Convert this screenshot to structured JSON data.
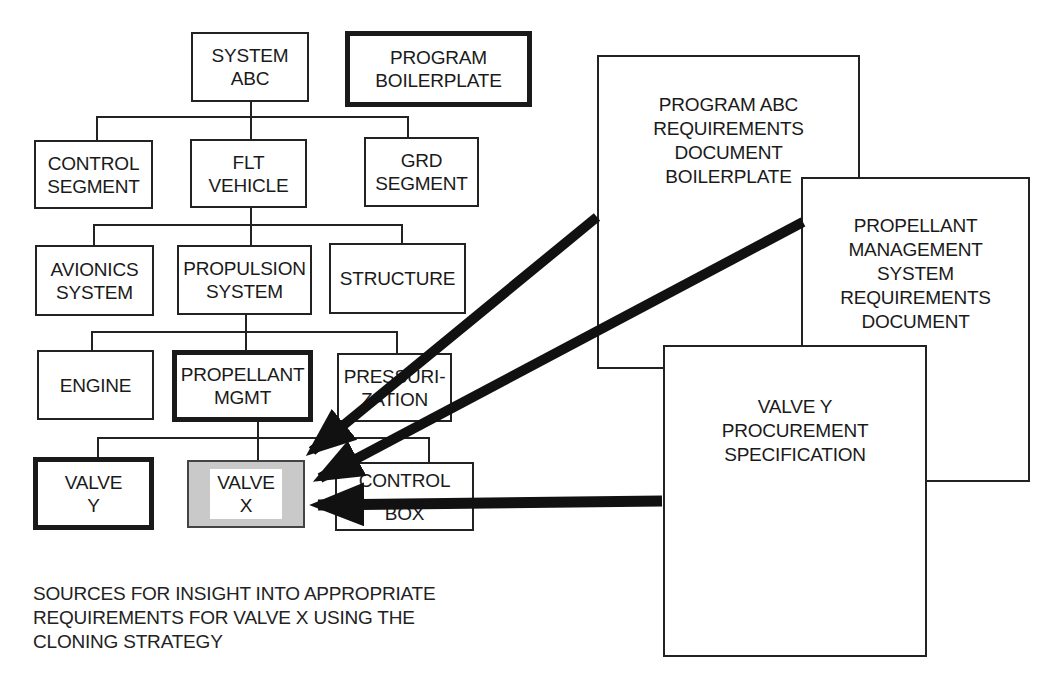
{
  "diagram": {
    "tree": {
      "system_abc": "SYSTEM\nABC",
      "program_boilerplate": "PROGRAM\nBOILERPLATE",
      "control_segment": "CONTROL\nSEGMENT",
      "flt_vehicle": "FLT\nVEHICLE",
      "grd_segment": "GRD\nSEGMENT",
      "avionics_system": "AVIONICS\nSYSTEM",
      "propulsion_system": "PROPULSION\nSYSTEM",
      "structure": "STRUCTURE",
      "engine": "ENGINE",
      "propellant_mgmt": "PROPELLANT\nMGMT",
      "pressurization": "PRESSURI-\nZATION",
      "valve_y": "VALVE\nY",
      "valve_x": "VALVE\nX",
      "control_box": "CONTROL\nBOX"
    },
    "documents": [
      {
        "label": "PROGRAM ABC\nREQUIREMENTS\nDOCUMENT\nBOILERPLATE"
      },
      {
        "label": "PROPELLANT\nMANAGEMENT\nSYSTEM\nREQUIREMENTS\nDOCUMENT"
      },
      {
        "label": "VALVE Y\nPROCUREMENT\nSPECIFICATION"
      }
    ],
    "caption": "SOURCES FOR INSIGHT INTO APPROPRIATE\nREQUIREMENTS FOR VALVE X USING THE\nCLONING STRATEGY",
    "colors": {
      "line": "#222222",
      "arrow": "#111111",
      "highlight_fill": "#c9c9c9",
      "background": "#ffffff"
    }
  }
}
